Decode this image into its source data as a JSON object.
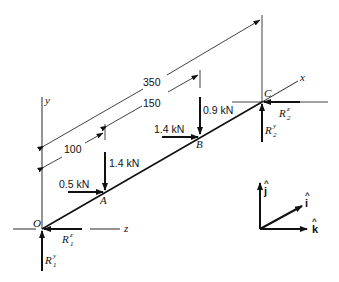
{
  "diagram": {
    "points": [
      {
        "id": "O",
        "label": "O"
      },
      {
        "id": "A",
        "label": "A"
      },
      {
        "id": "B",
        "label": "B"
      },
      {
        "id": "C",
        "label": "C"
      }
    ],
    "axes": {
      "x": "x",
      "y": "y",
      "z": "z"
    },
    "dimensions": [
      {
        "label": "100",
        "from": "O",
        "to": "A"
      },
      {
        "label": "150",
        "from": "A",
        "to": "B"
      },
      {
        "label": "350",
        "from": "O",
        "to": "C"
      }
    ],
    "loads": [
      {
        "label": "1.4 kN",
        "at": "A",
        "direction": "-y"
      },
      {
        "label": "0.5 kN",
        "at": "A",
        "direction": "+z"
      },
      {
        "label": "1.4 kN",
        "at": "B",
        "direction": "+z"
      },
      {
        "label": "0.9 kN",
        "at": "B",
        "direction": "-y"
      }
    ],
    "reactions": [
      {
        "base": "R",
        "sub": "1",
        "sup": "z",
        "at": "O"
      },
      {
        "base": "R",
        "sub": "1",
        "sup": "y",
        "at": "O"
      },
      {
        "base": "R",
        "sub": "2",
        "sup": "z",
        "at": "C"
      },
      {
        "base": "R",
        "sub": "2",
        "sup": "y",
        "at": "C"
      }
    ],
    "unit_vectors": {
      "j": "j",
      "i": "i",
      "k": "k",
      "hat": "^"
    },
    "colors": {
      "ink": "#111111",
      "background": "#ffffff"
    }
  }
}
